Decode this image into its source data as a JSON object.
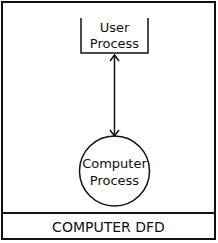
{
  "diagram": {
    "title": "COMPUTER DFD",
    "nodes": [
      {
        "id": "user",
        "type": "external-entity-box",
        "label_lines": [
          "User",
          "Process"
        ]
      },
      {
        "id": "computer",
        "type": "process-circle",
        "label_lines": [
          "Computer",
          "Process"
        ]
      }
    ],
    "edges": [
      {
        "from": "user",
        "to": "computer",
        "direction": "bidirectional"
      }
    ],
    "colors": {
      "stroke": "#111111",
      "background": "#ffffff"
    }
  }
}
